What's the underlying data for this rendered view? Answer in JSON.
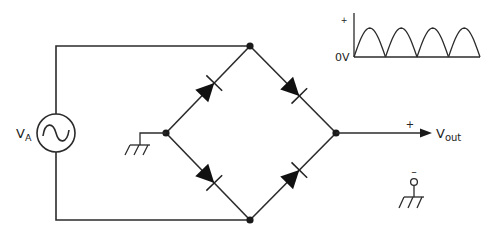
{
  "diagram": {
    "source": {
      "label": "V",
      "label_subscript": "A",
      "symbol": "ac-sine-source-icon"
    },
    "output": {
      "label": "V",
      "label_subscript": "out",
      "positive_sign": "+",
      "negative_sign": "–"
    },
    "diodes": [
      {
        "name": "diode-upper-left",
        "direction": "left-node to top-node"
      },
      {
        "name": "diode-upper-right",
        "direction": "top-node to right-node"
      },
      {
        "name": "diode-lower-left",
        "direction": "left-node to bottom-node"
      },
      {
        "name": "diode-lower-right",
        "direction": "bottom-node to right-node"
      }
    ],
    "waveform": {
      "plus_label": "+",
      "zero_label": "0V",
      "shape": "full-wave rectified sine",
      "half_cycles": 4
    },
    "grounds": [
      "bridge-left-node",
      "output-negative"
    ]
  }
}
